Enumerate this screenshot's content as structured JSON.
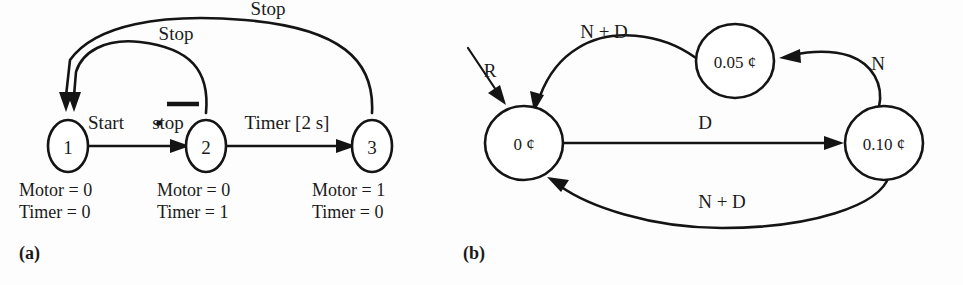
{
  "figure": {
    "panels": [
      {
        "caption": "(a)",
        "title": "motor-control-state-diagram",
        "states": [
          {
            "id": "1",
            "label": "1",
            "outputs": [
              "Motor = 0",
              "Timer = 0"
            ]
          },
          {
            "id": "2",
            "label": "2",
            "outputs": [
              "Motor = 0",
              "Timer = 1"
            ]
          },
          {
            "id": "3",
            "label": "3",
            "outputs": [
              "Motor = 1",
              "Timer = 0"
            ]
          }
        ],
        "transitions": [
          {
            "from": "1",
            "to": "2",
            "label_prefix": "Start",
            "label_op": "•",
            "label_negated": "stop",
            "label_full": "Start • stop"
          },
          {
            "from": "2",
            "to": "3",
            "label": "Timer [2 s]"
          },
          {
            "from": "2",
            "to": "1",
            "label": "Stop"
          },
          {
            "from": "3",
            "to": "1",
            "label": "Stop"
          }
        ]
      },
      {
        "caption": "(b)",
        "title": "vending-machine-state-diagram",
        "states": [
          {
            "id": "zero",
            "label": "0 ¢"
          },
          {
            "id": "five",
            "label": "0.05 ¢"
          },
          {
            "id": "ten",
            "label": "0.10 ¢"
          }
        ],
        "transitions": [
          {
            "from": "reset",
            "to": "zero",
            "label": "R"
          },
          {
            "from": "five",
            "to": "zero",
            "label": "N + D"
          },
          {
            "from": "zero",
            "to": "ten",
            "label": "D"
          },
          {
            "from": "ten",
            "to": "five",
            "label": "N"
          },
          {
            "from": "ten",
            "to": "zero",
            "label": "N + D"
          }
        ]
      }
    ]
  },
  "colors": {
    "ink": "#141414",
    "page": "#fdfdfd",
    "node_fill": "#ffffff"
  }
}
